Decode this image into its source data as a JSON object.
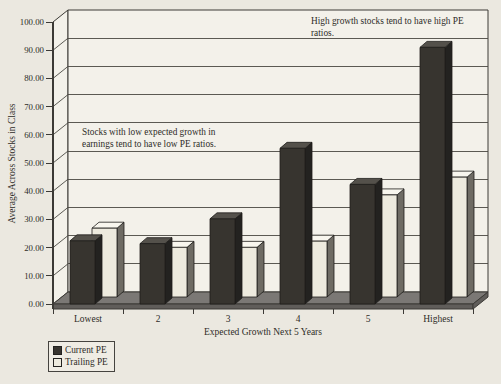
{
  "chart_data": {
    "type": "bar",
    "style": "3d-column",
    "categories": [
      "Lowest",
      "2",
      "3",
      "4",
      "5",
      "Highest"
    ],
    "series": [
      {
        "name": "Current PE",
        "values": [
          22.4,
          21.4,
          30.2,
          55.2,
          42.4,
          91.0
        ]
      },
      {
        "name": "Trailing PE",
        "values": [
          24.4,
          17.6,
          17.6,
          19.8,
          36.2,
          42.5
        ]
      }
    ],
    "xlabel": "Expected Growth Next 5 Years",
    "ylabel": "Average Across Stocks in Class",
    "ylim": [
      0,
      100
    ],
    "ytick_step": 10,
    "ytick_decimals": 2,
    "grid": true,
    "legend_position": "bottom-left",
    "annotations": [
      {
        "text": "Stocks with low expected growth in\nearnings tend to have low PE ratios.",
        "x": 82,
        "y": 126
      },
      {
        "text": "High growth stocks tend to have high PE ratios.",
        "x": 311,
        "y": 15
      }
    ]
  },
  "colors": {
    "background": "#ebe8e0",
    "wall": "#f3f1ea",
    "wall_border": "#3c3a36",
    "gridline": "#4a4843",
    "floor_top": "#7b7875",
    "floor_front": "#605d5a",
    "current_pe": {
      "front": "#37342f",
      "top": "#54514b",
      "side": "#232220"
    },
    "trailing_pe": {
      "front": "#edeade",
      "top": "#f8f6ee",
      "side": "#6e6b64"
    },
    "bar_outline": "#1e1d1b",
    "text": "#2e2c28",
    "legend_bg": "#efece4"
  }
}
